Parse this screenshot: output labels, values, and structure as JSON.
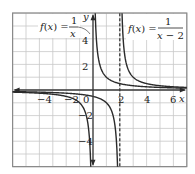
{
  "chart_data": {
    "type": "line",
    "title": "",
    "xlabel": "x",
    "ylabel": "y",
    "xlim": [
      -6,
      7
    ],
    "ylim": [
      -6,
      6
    ],
    "grid": true,
    "x_ticks": [
      -4,
      -2,
      0,
      2,
      4,
      6
    ],
    "y_ticks": [
      4,
      2,
      -2,
      -4
    ],
    "x_tick_labels": [
      "−4",
      "−2",
      "0",
      "2",
      "4",
      "6"
    ],
    "y_tick_labels": [
      "4",
      "2",
      "−2",
      "−4"
    ],
    "series": [
      {
        "name": "f(x) = 1/x",
        "expression": "1/x",
        "vertical_asymptote": 0,
        "horizontal_asymptote": 0,
        "line_style": "solid"
      },
      {
        "name": "f(x) = 1/(x − 2)",
        "expression": "1/(x-2)",
        "vertical_asymptote": 2,
        "horizontal_asymptote": 0,
        "line_style": "solid"
      }
    ],
    "annotations": [
      {
        "type": "dashed-vertical-line",
        "x": 2,
        "label": "asymptote x = 2"
      },
      {
        "type": "label",
        "text": "f(x) = 1/x",
        "position": "upper-left",
        "points_to": "f(x) = 1/x curve"
      },
      {
        "type": "label",
        "text": "f(x) = 1/(x − 2)",
        "position": "upper-right"
      }
    ]
  },
  "labels": {
    "x_axis": "x",
    "y_axis": "y",
    "eq1": {
      "lhs": "f(x) =",
      "num": "1",
      "den": "x"
    },
    "eq2": {
      "lhs": "f(x) =",
      "num": "1",
      "den": "x − 2"
    },
    "ticks": {
      "xm4": "−4",
      "xm2": "−2",
      "x0": "0",
      "x2": "2",
      "x4": "4",
      "x6": "6",
      "y4": "4",
      "y2": "2",
      "ym2": "−2",
      "ym4": "−4"
    }
  }
}
